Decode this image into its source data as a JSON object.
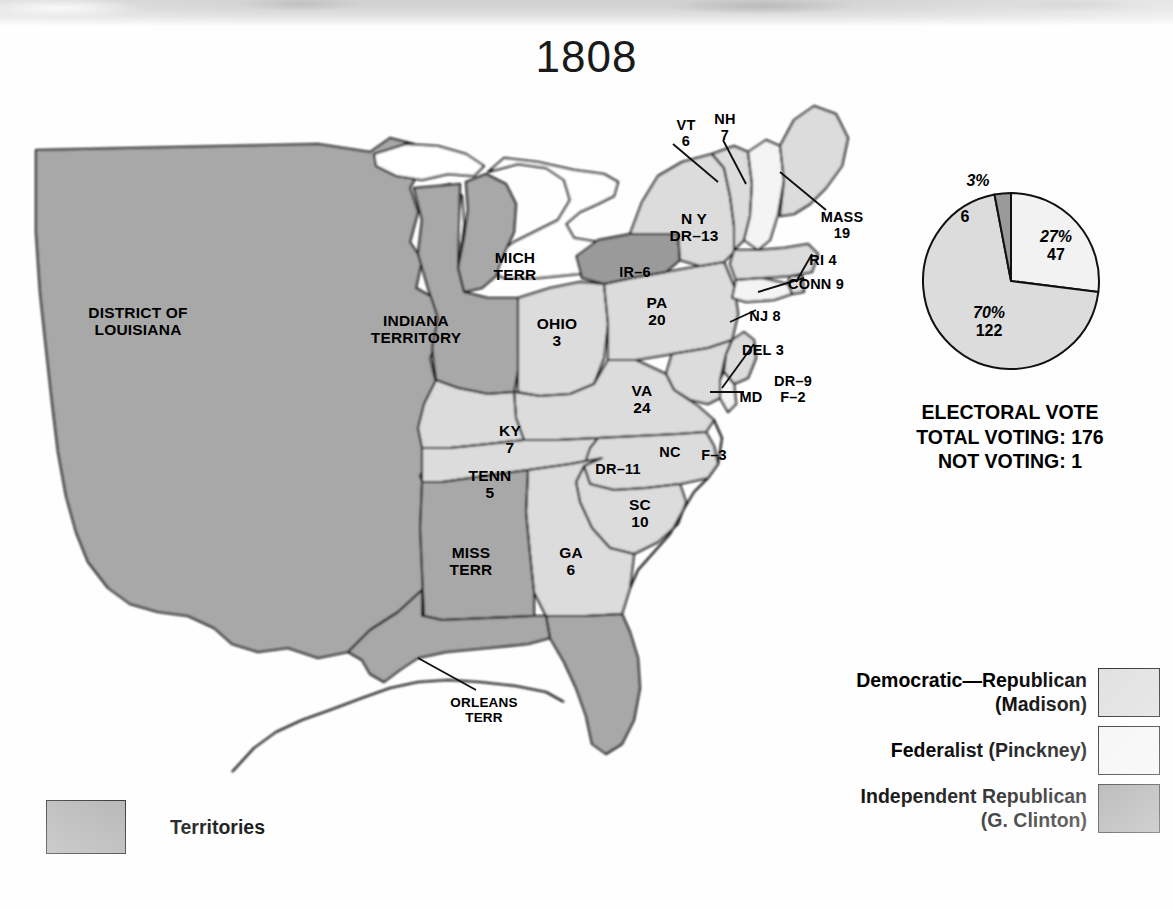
{
  "title": "1808",
  "map": {
    "labels": [
      {
        "id": "district-of-louisiana",
        "text": "DISTRICT OF\nLOUISIANA",
        "x": 120,
        "y": 212,
        "size": "s16"
      },
      {
        "id": "indiana-territory",
        "text": "INDIANA\nTERRITORY",
        "x": 398,
        "y": 220,
        "size": "s16"
      },
      {
        "id": "michigan-territory",
        "text": "MICH\nTERR",
        "x": 497,
        "y": 157,
        "size": "s16"
      },
      {
        "id": "ohio",
        "text": "OHIO\n3",
        "x": 539,
        "y": 223,
        "size": "s16"
      },
      {
        "id": "pennsylvania",
        "text": "PA\n20",
        "x": 639,
        "y": 202,
        "size": "s16"
      },
      {
        "id": "new-york",
        "text": "N Y\nDR–13",
        "x": 676,
        "y": 118,
        "size": "s16"
      },
      {
        "id": "independent-republican-ny",
        "text": "IR–6",
        "x": 617,
        "y": 172,
        "size": "s15"
      },
      {
        "id": "vermont",
        "text": "VT\n6",
        "x": 668,
        "y": 25,
        "size": "s15"
      },
      {
        "id": "new-hampshire",
        "text": "NH\n7",
        "x": 707,
        "y": 19,
        "size": "s15"
      },
      {
        "id": "massachusetts",
        "text": "MASS\n19",
        "x": 824,
        "y": 117,
        "size": "s15"
      },
      {
        "id": "rhode-island",
        "text": "RI 4",
        "x": 805,
        "y": 160,
        "size": "s15"
      },
      {
        "id": "connecticut",
        "text": "CONN 9",
        "x": 798,
        "y": 184,
        "size": "s15"
      },
      {
        "id": "new-jersey",
        "text": "NJ 8",
        "x": 747,
        "y": 216,
        "size": "s15"
      },
      {
        "id": "delaware",
        "text": "DEL 3",
        "x": 745,
        "y": 250,
        "size": "s15"
      },
      {
        "id": "maryland",
        "text": "MD",
        "x": 733,
        "y": 297,
        "size": "s15"
      },
      {
        "id": "maryland-votes",
        "text": "DR–9\nF–2",
        "x": 775,
        "y": 281,
        "size": "s15"
      },
      {
        "id": "virginia",
        "text": "VA\n24",
        "x": 624,
        "y": 290,
        "size": "s16"
      },
      {
        "id": "kentucky",
        "text": "KY\n7",
        "x": 492,
        "y": 330,
        "size": "s16"
      },
      {
        "id": "tennessee",
        "text": "TENN\n5",
        "x": 472,
        "y": 375,
        "size": "s16"
      },
      {
        "id": "north-carolina",
        "text": "NC",
        "x": 652,
        "y": 352,
        "size": "s15"
      },
      {
        "id": "north-carolina-votes",
        "text": "DR–11",
        "x": 600,
        "y": 369,
        "size": "s15"
      },
      {
        "id": "north-carolina-fed",
        "text": "F–3",
        "x": 696,
        "y": 355,
        "size": "s15"
      },
      {
        "id": "south-carolina",
        "text": "SC\n10",
        "x": 622,
        "y": 404,
        "size": "s16"
      },
      {
        "id": "georgia",
        "text": "GA\n6",
        "x": 553,
        "y": 452,
        "size": "s16"
      },
      {
        "id": "mississippi-territory",
        "text": "MISS\nTERR",
        "x": 453,
        "y": 452,
        "size": "s16"
      },
      {
        "id": "orleans-territory",
        "text": "ORLEANS\nTERR",
        "x": 466,
        "y": 603,
        "size": "s14"
      }
    ]
  },
  "chart_data": {
    "type": "pie",
    "title": "ELECTORAL VOTE",
    "total_voting_label": "TOTAL VOTING: 176",
    "not_voting_label": "NOT VOTING: 1",
    "total_voting": 176,
    "not_voting": 1,
    "slices": [
      {
        "label": "Democratic—Republican (Madison)",
        "percent": 70,
        "percent_text": "70%",
        "votes": 122,
        "votes_text": "122",
        "color": "#dcdcdc"
      },
      {
        "label": "Federalist (Pinckney)",
        "percent": 27,
        "percent_text": "27%",
        "votes": 47,
        "votes_text": "47",
        "color": "#f2f2f2"
      },
      {
        "label": "Independent Republican (G. Clinton)",
        "percent": 3,
        "percent_text": "3%",
        "votes": 6,
        "votes_text": "6",
        "color": "#9a9a9a"
      }
    ]
  },
  "legend": {
    "items": [
      {
        "id": "democratic-republican",
        "lines": [
          "Democratic—Republican",
          "(Madison)"
        ],
        "color": "#dcdcdc"
      },
      {
        "id": "federalist",
        "lines": [
          "Federalist (Pinckney)"
        ],
        "color": "#f4f4f4"
      },
      {
        "id": "independent-republican",
        "lines": [
          "Independent Republican",
          "(G. Clinton)"
        ],
        "color": "#9a9a9a"
      }
    ]
  },
  "territories_key": {
    "label": "Territories",
    "color": "#a8a8a8"
  },
  "colors": {
    "territory": "#a8a8a8",
    "democratic_republican": "#dcdcdc",
    "federalist": "#f4f4f4",
    "independent_republican": "#9a9a9a",
    "outline": "#111111",
    "page": "#ffffff"
  }
}
